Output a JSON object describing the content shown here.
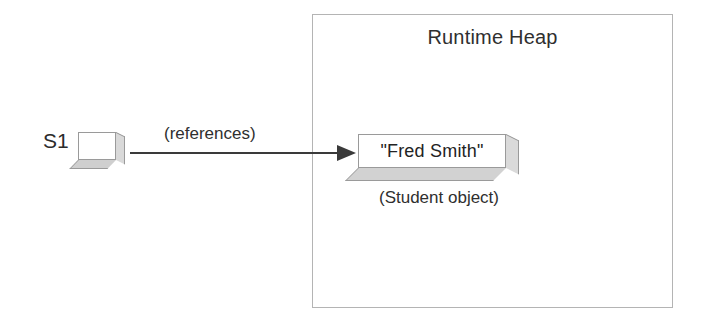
{
  "diagram": {
    "title": "Runtime Heap",
    "heap": {
      "label": "Runtime Heap"
    },
    "reference_variable": {
      "name": "S1",
      "shape": "cube-icon"
    },
    "arrow": {
      "label": "(references)",
      "direction": "left-to-right",
      "icon": "arrow-right-icon"
    },
    "object": {
      "value": "\"Fred Smith\"",
      "caption": "(Student object)",
      "shape": "slab-icon"
    },
    "colors": {
      "background": "#ffffff",
      "box_border": "#b4b4b4",
      "shape_border": "#9a9a9a",
      "shape_side_fill": "#d9d9d9",
      "shape_bottom_fill": "#cfcfcf",
      "text": "#2b2b2b",
      "arrow": "#3a3a3a"
    }
  }
}
